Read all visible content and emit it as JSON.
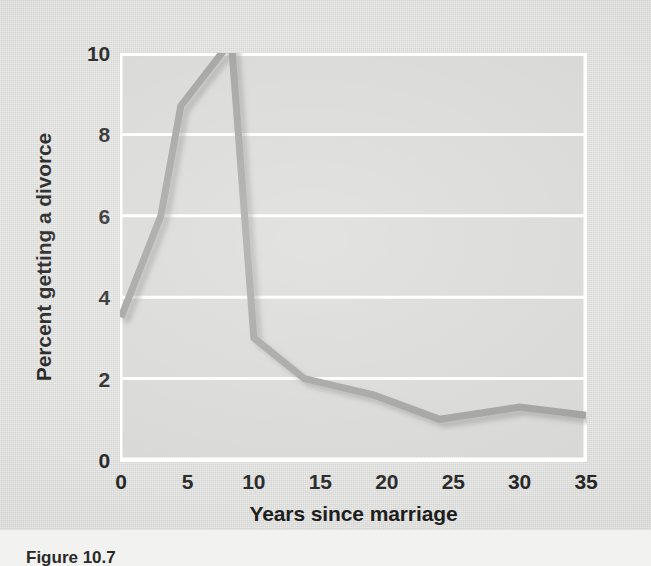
{
  "figure": {
    "caption": "Figure 10.7",
    "background_color": "#dcdcda",
    "plot_background_color": "#d6d6d4"
  },
  "chart_data": {
    "type": "line",
    "title": "",
    "subtitle": "",
    "xlabel": "Years since marriage",
    "ylabel": "Percent getting a divorce",
    "xlim": [
      0,
      35
    ],
    "ylim": [
      0,
      10
    ],
    "xticks": [
      0,
      5,
      10,
      15,
      20,
      25,
      30,
      35
    ],
    "yticks": [
      0,
      2,
      4,
      6,
      8,
      10
    ],
    "xtick_labels": [
      "0",
      "5",
      "10",
      "15",
      "20",
      "25",
      "30",
      "35"
    ],
    "ytick_labels": [
      "0",
      "2",
      "4",
      "6",
      "8",
      "10"
    ],
    "grid": "horizontal",
    "grid_color": "#ffffff",
    "axis_color": "#ffffff",
    "legend": "none",
    "line_color": "#9c9c9a",
    "line_width": 7,
    "shadow_color": "#b9b9b7",
    "series": [
      {
        "name": "Percent getting a divorce",
        "x": [
          0,
          3,
          4.5,
          8.3,
          10,
          13.8,
          19,
          24,
          30,
          35
        ],
        "values": [
          3.5,
          6.0,
          8.7,
          10.3,
          3.0,
          2.0,
          1.6,
          1.0,
          1.3,
          1.1
        ]
      }
    ],
    "annotations": []
  }
}
